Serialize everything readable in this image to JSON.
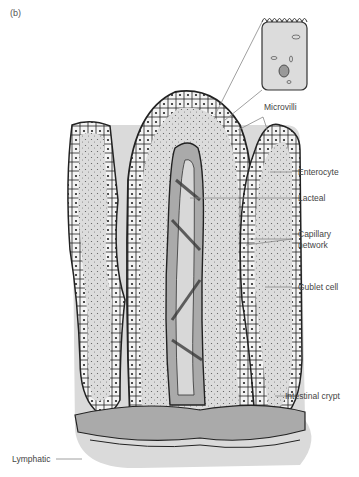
{
  "figure": {
    "panel_label": "(b)",
    "colors": {
      "tissue_fill": "#d9d9d9",
      "vessel_fill": "#a9a9a9",
      "outline": "#222222",
      "label_text": "#444444",
      "leader_line": "#888888"
    },
    "labels": {
      "microvilli": "Microvilli",
      "enterocyte": "Enterocyte",
      "lacteal": "Lacteal",
      "capillary_line1": "Capillary",
      "capillary_line2": "network",
      "goblet_cell": "Gublet cell",
      "intestinal_crypt": "Intestinal crypt",
      "lymphatic": "Lymphatic"
    }
  }
}
